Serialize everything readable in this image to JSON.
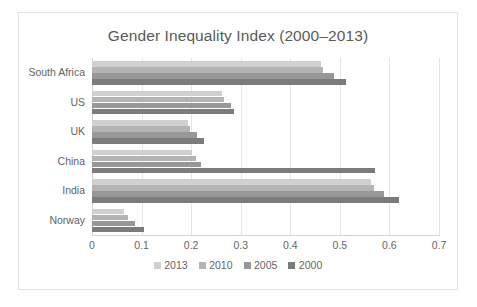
{
  "chart_data": {
    "type": "bar",
    "orientation": "horizontal",
    "title": "Gender Inequality Index (2000–2013)",
    "xlabel": "",
    "ylabel": "",
    "xlim": [
      0,
      0.7
    ],
    "xticks": [
      "0",
      "0.1",
      "0.2",
      "0.3",
      "0.4",
      "0.5",
      "0.6",
      "0.7"
    ],
    "xtick_values": [
      0,
      0.1,
      0.2,
      0.3,
      0.4,
      0.5,
      0.6,
      0.7
    ],
    "grid": true,
    "grid_axis": "x",
    "legend_position": "bottom",
    "categories": [
      "South Africa",
      "US",
      "UK",
      "China",
      "India",
      "Norway"
    ],
    "series": [
      {
        "name": "2013",
        "color": "#d0d0d0",
        "values": [
          0.461,
          0.262,
          0.193,
          0.202,
          0.563,
          0.065
        ]
      },
      {
        "name": "2010",
        "color": "#b4b4b4",
        "values": [
          0.466,
          0.266,
          0.197,
          0.209,
          0.568,
          0.073
        ]
      },
      {
        "name": "2005",
        "color": "#989898",
        "values": [
          0.488,
          0.281,
          0.212,
          0.219,
          0.589,
          0.086
        ]
      },
      {
        "name": "2000",
        "color": "#7c7c7c",
        "values": [
          0.513,
          0.286,
          0.225,
          0.571,
          0.619,
          0.105
        ]
      }
    ]
  },
  "frame": {
    "border_color": "#e2e2e2",
    "background": "#ffffff"
  }
}
